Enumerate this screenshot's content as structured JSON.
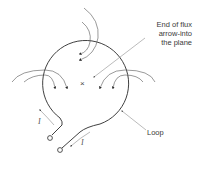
{
  "diagram": {
    "type": "current-loop-magnetic-flux",
    "labels": {
      "flux_end_line1": "End of flux",
      "flux_end_line2": "arrow-into",
      "flux_end_line3": "the plane",
      "loop": "Loop",
      "current_left": "I",
      "current_right": "I"
    },
    "center_symbol": "×",
    "colors": {
      "line": "#2a2a2a",
      "flux": "#555555",
      "leader": "#777777",
      "text": "#3a3a3a"
    }
  }
}
